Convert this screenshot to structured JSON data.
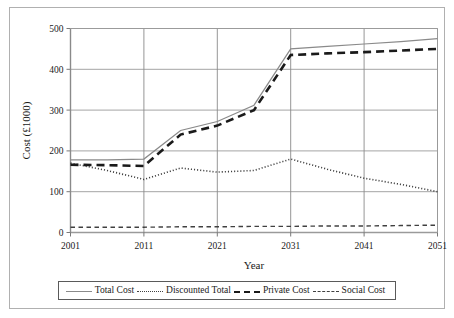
{
  "chart_data": {
    "type": "line",
    "title": "",
    "xlabel": "Year",
    "ylabel": "Cost (£1000)",
    "xlim": [
      2001,
      2051
    ],
    "ylim": [
      0,
      500
    ],
    "xticks": [
      "2001",
      "2011",
      "2021",
      "2031",
      "2041",
      "2051"
    ],
    "yticks": [
      "0",
      "100",
      "200",
      "300",
      "400",
      "500"
    ],
    "grid": "horizontal-and-vertical-at-ticks",
    "legend_position": "below-plot",
    "x": [
      2001,
      2006,
      2011,
      2016,
      2021,
      2026,
      2031,
      2036,
      2041,
      2046,
      2051
    ],
    "series": [
      {
        "name": "Total Cost",
        "style": "solid",
        "color": "#8a8a8a",
        "width": 1.2,
        "values": [
          178,
          178,
          180,
          250,
          272,
          312,
          450,
          456,
          462,
          468,
          475
        ]
      },
      {
        "name": "Discounted Total",
        "style": "dotted",
        "color": "#404040",
        "width": 1.6,
        "values": [
          170,
          152,
          130,
          158,
          148,
          152,
          180,
          155,
          133,
          118,
          100
        ]
      },
      {
        "name": "Private Cost",
        "style": "dashed",
        "color": "#1a1a1a",
        "width": 2.6,
        "values": [
          166,
          165,
          163,
          240,
          262,
          300,
          435,
          439,
          442,
          446,
          450
        ]
      },
      {
        "name": "Social Cost",
        "style": "dashdot",
        "color": "#404040",
        "width": 1.4,
        "values": [
          13,
          13,
          13,
          14,
          14,
          15,
          15,
          16,
          16,
          17,
          18
        ]
      }
    ]
  },
  "legend": {
    "entries": [
      {
        "label": "Total Cost"
      },
      {
        "label": "Discounted Total"
      },
      {
        "label": "Private Cost"
      },
      {
        "label": "Social Cost"
      }
    ]
  }
}
